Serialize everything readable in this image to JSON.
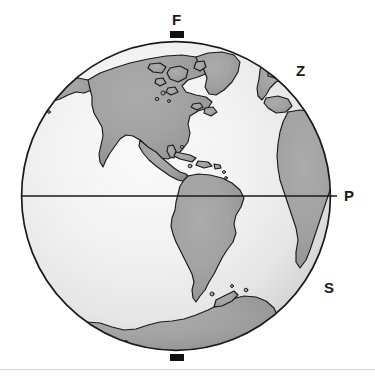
{
  "figure": {
    "type": "globe-diagram",
    "canvas": {
      "width": 375,
      "height": 379,
      "background": "#ffffff"
    },
    "globe": {
      "center_x": 176,
      "center_y": 196,
      "radius": 155,
      "outline_color": "#1a1a1a",
      "outline_width": 1.6,
      "ocean_light_color": "#f5f5f5",
      "ocean_mid_color": "#e3e3e3",
      "ocean_dark_color": "#b9b9b9",
      "land_color": "#9d9d9d",
      "land_outline_color": "#1a1a1a",
      "land_outline_width": 1.2,
      "shading": "radial-gradient highlight upper-left, darker toward limb"
    },
    "equator": {
      "label": "equator",
      "y": 196,
      "x_start": 21,
      "x_end": 337,
      "color": "#1a1a1a",
      "width": 1.5
    },
    "pole_markers": [
      {
        "name": "north-pole-tick",
        "x": 170,
        "y": 31,
        "width": 14,
        "height": 7,
        "color": "#111111"
      },
      {
        "name": "south-pole-tick",
        "x": 170,
        "y": 354,
        "width": 14,
        "height": 7,
        "color": "#111111"
      }
    ],
    "labels": [
      {
        "id": "F",
        "text": "F",
        "position": "top",
        "x": 172,
        "y": 12
      },
      {
        "id": "Z",
        "text": "Z",
        "position": "upper-right",
        "x": 296,
        "y": 63
      },
      {
        "id": "P",
        "text": "P",
        "position": "right-equator",
        "x": 344,
        "y": 188
      },
      {
        "id": "S",
        "text": "S",
        "position": "lower-right",
        "x": 324,
        "y": 280
      }
    ],
    "landmasses": [
      "North America",
      "Greenland",
      "Central America",
      "Caribbean islands",
      "South America",
      "West Africa",
      "Western Europe",
      "Antarctica"
    ],
    "bottom_rule": {
      "y": 369,
      "color": "#d6d6d6",
      "height": 1
    }
  }
}
